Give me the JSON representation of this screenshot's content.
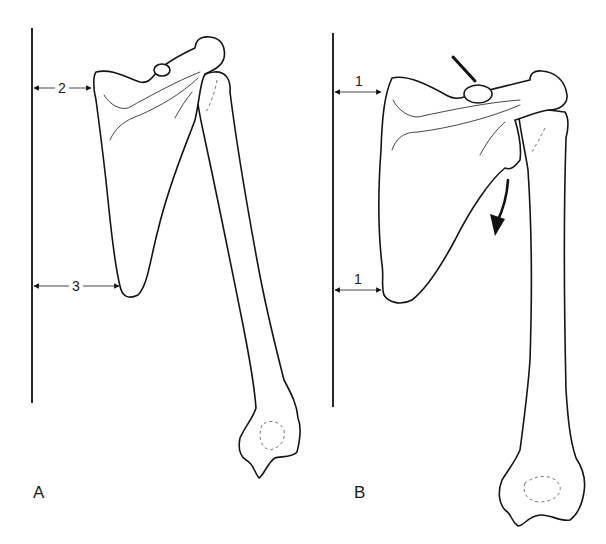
{
  "figure": {
    "colors": {
      "line": "#151515",
      "background": "#ffffff"
    }
  },
  "panels": [
    {
      "label": "A",
      "reference_line": {
        "x": 32,
        "y1": 28,
        "y2": 403
      },
      "measurements": [
        {
          "label": "2",
          "position": "superior (medial border at spine)",
          "y": 88,
          "x1": 33,
          "x2": 92
        },
        {
          "label": "3",
          "position": "inferior angle",
          "y": 286,
          "x1": 33,
          "x2": 120
        }
      ]
    },
    {
      "label": "B",
      "reference_line": {
        "x": 333,
        "y1": 33,
        "y2": 407
      },
      "measurements": [
        {
          "label": "1",
          "position": "superior (medial border at spine)",
          "y": 92,
          "x1": 335,
          "x2": 382
        },
        {
          "label": "1",
          "position": "inferior angle",
          "y": 290,
          "x1": 335,
          "x2": 382
        }
      ],
      "annotations": [
        {
          "type": "pointer-line",
          "target": "acromioclavicular region"
        },
        {
          "type": "curved-arrow",
          "direction": "downward",
          "meaning": "rotation of scapula"
        }
      ]
    }
  ]
}
